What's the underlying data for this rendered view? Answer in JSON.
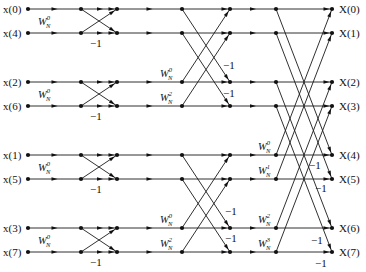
{
  "diagram": {
    "colors": {
      "line": "#1a1a1a",
      "background": "#ffffff"
    },
    "columns_x": [
      28,
      81,
      117,
      182,
      230,
      276,
      332
    ],
    "rows_y": [
      9,
      33,
      82,
      106,
      155,
      179,
      228,
      252
    ],
    "inputs": [
      "x(0)",
      "x(4)",
      "x(2)",
      "x(6)",
      "x(1)",
      "x(5)",
      "x(3)",
      "x(7)"
    ],
    "outputs": [
      "X(0)",
      "X(1)",
      "X(2)",
      "X(3)",
      "X(4)",
      "X(5)",
      "X(6)",
      "X(7)"
    ],
    "stage1": {
      "twiddles": [
        {
          "base": "W",
          "sub": "N",
          "sup": "0"
        },
        {
          "base": "W",
          "sub": "N",
          "sup": "0"
        },
        {
          "base": "W",
          "sub": "N",
          "sup": "0"
        },
        {
          "base": "W",
          "sub": "N",
          "sup": "0"
        }
      ],
      "minus_one": [
        "−1",
        "−1",
        "−1",
        "−1"
      ]
    },
    "stage2": {
      "twiddles": [
        {
          "base": "W",
          "sub": "N",
          "sup": "0"
        },
        {
          "base": "W",
          "sub": "N",
          "sup": "2"
        },
        {
          "base": "W",
          "sub": "N",
          "sup": "0"
        },
        {
          "base": "W",
          "sub": "N",
          "sup": "2"
        }
      ],
      "minus_one": [
        "−1",
        "−1",
        "−1",
        "−1"
      ]
    },
    "stage3": {
      "twiddles": [
        {
          "base": "W",
          "sub": "N",
          "sup": "0"
        },
        {
          "base": "W",
          "sub": "N",
          "sup": "1"
        },
        {
          "base": "W",
          "sub": "N",
          "sup": "2"
        },
        {
          "base": "W",
          "sub": "N",
          "sup": "3"
        }
      ],
      "minus_one": [
        "−1",
        "−1",
        "−1",
        "−1"
      ]
    }
  }
}
